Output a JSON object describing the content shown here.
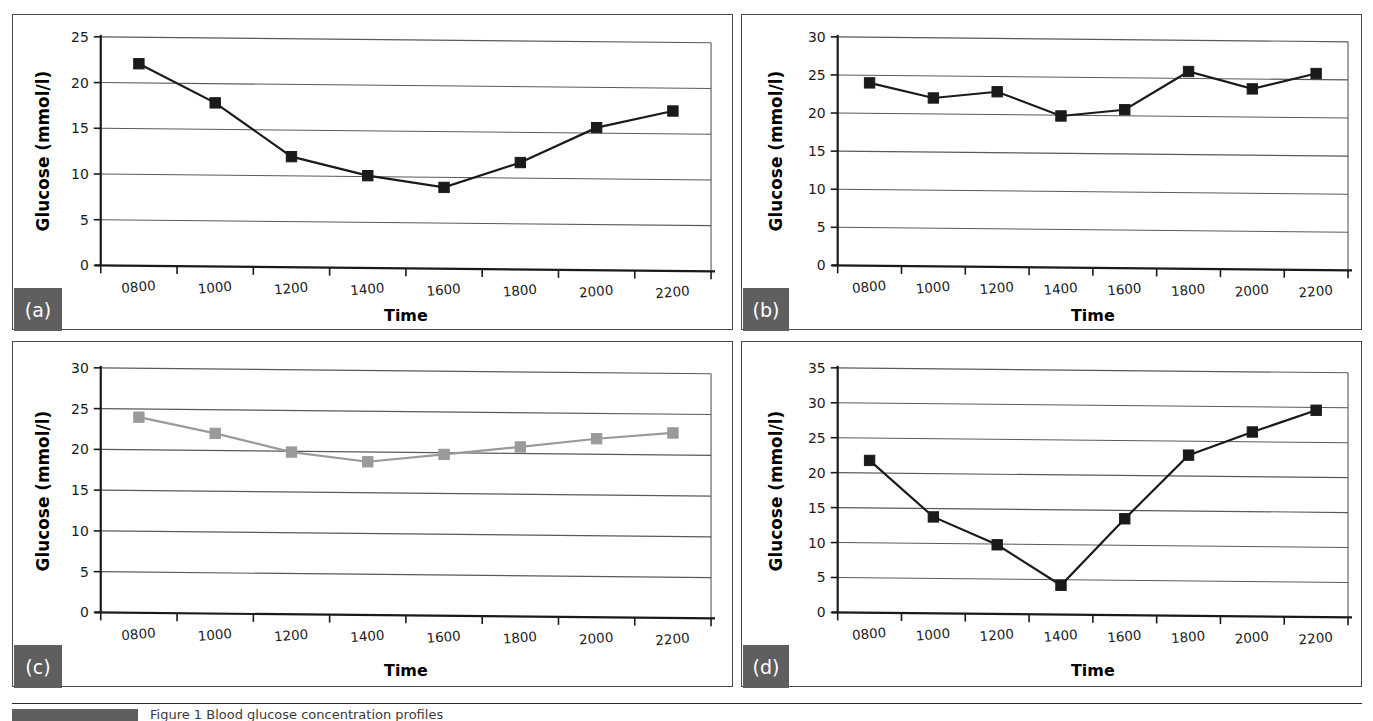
{
  "figure": {
    "panels": [
      {
        "tag": "(a)"
      },
      {
        "tag": "(b)"
      },
      {
        "tag": "(c)"
      },
      {
        "tag": "(d)"
      }
    ],
    "caption": "Figure 1  Blood glucose concentration profiles"
  },
  "colors": {
    "series_dark": "#1a1a1a",
    "series_gray": "#9a9a9a",
    "grid": "#5a5a5a",
    "axis": "#1a1a1a",
    "tag_background": "#5f5f5f",
    "panel_border": "#4a4a4a",
    "background": "#ffffff"
  },
  "chart_data": [
    {
      "id": "a",
      "type": "line",
      "title": "",
      "xlabel": "Time",
      "ylabel": "Glucose (mmol/l)",
      "categories": [
        "0800",
        "1000",
        "1200",
        "1400",
        "1600",
        "1800",
        "2000",
        "2200"
      ],
      "values": [
        22.1,
        17.9,
        12.1,
        10.1,
        8.9,
        11.7,
        15.6,
        17.5
      ],
      "yticks": [
        0,
        5,
        10,
        15,
        20,
        25
      ],
      "ylim": [
        0,
        25
      ],
      "grid": true,
      "legend": "none",
      "marker": "square",
      "series_color": "#1a1a1a"
    },
    {
      "id": "b",
      "type": "line",
      "title": "",
      "xlabel": "Time",
      "ylabel": "Glucose (mmol/l)",
      "categories": [
        "0800",
        "1000",
        "1200",
        "1400",
        "1600",
        "1800",
        "2000",
        "2200"
      ],
      "values": [
        24.0,
        22.1,
        23.0,
        19.9,
        20.8,
        25.9,
        23.7,
        25.8
      ],
      "yticks": [
        0,
        5,
        10,
        15,
        20,
        25,
        30
      ],
      "ylim": [
        0,
        30
      ],
      "grid": true,
      "legend": "none",
      "marker": "square",
      "series_color": "#1a1a1a"
    },
    {
      "id": "c",
      "type": "line",
      "title": "",
      "xlabel": "Time",
      "ylabel": "Glucose (mmol/l)",
      "categories": [
        "0800",
        "1000",
        "1200",
        "1400",
        "1600",
        "1800",
        "2000",
        "2200"
      ],
      "values": [
        24.0,
        22.1,
        19.9,
        18.8,
        19.8,
        20.8,
        21.9,
        22.7
      ],
      "yticks": [
        0,
        5,
        10,
        15,
        20,
        25,
        30
      ],
      "ylim": [
        0,
        30
      ],
      "grid": true,
      "legend": "none",
      "marker": "square",
      "series_color": "#9a9a9a"
    },
    {
      "id": "d",
      "type": "line",
      "title": "",
      "xlabel": "Time",
      "ylabel": "Glucose (mmol/l)",
      "categories": [
        "0800",
        "1000",
        "1200",
        "1400",
        "1600",
        "1800",
        "2000",
        "2200"
      ],
      "values": [
        21.8,
        13.8,
        9.9,
        4.2,
        13.8,
        23.0,
        26.4,
        29.6
      ],
      "yticks": [
        0,
        5,
        10,
        15,
        20,
        25,
        30,
        35
      ],
      "ylim": [
        0,
        35
      ],
      "grid": true,
      "legend": "none",
      "marker": "square",
      "series_color": "#1a1a1a"
    }
  ]
}
